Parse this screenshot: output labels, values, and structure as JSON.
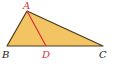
{
  "diagram": {
    "colors": {
      "fill": "#f2c463",
      "edge": "#4a3a1a",
      "segment": "#d8323a",
      "label_red": "#d8323a",
      "label_black": "#222222"
    },
    "points": {
      "A": {
        "label": "A",
        "x": 27,
        "y": 11
      },
      "B": {
        "label": "B",
        "x": 7,
        "y": 46
      },
      "C": {
        "label": "C",
        "x": 103,
        "y": 46
      },
      "D": {
        "label": "D",
        "x": 46,
        "y": 46
      }
    },
    "segments": [
      "AB",
      "BC",
      "CA",
      "AD"
    ]
  }
}
